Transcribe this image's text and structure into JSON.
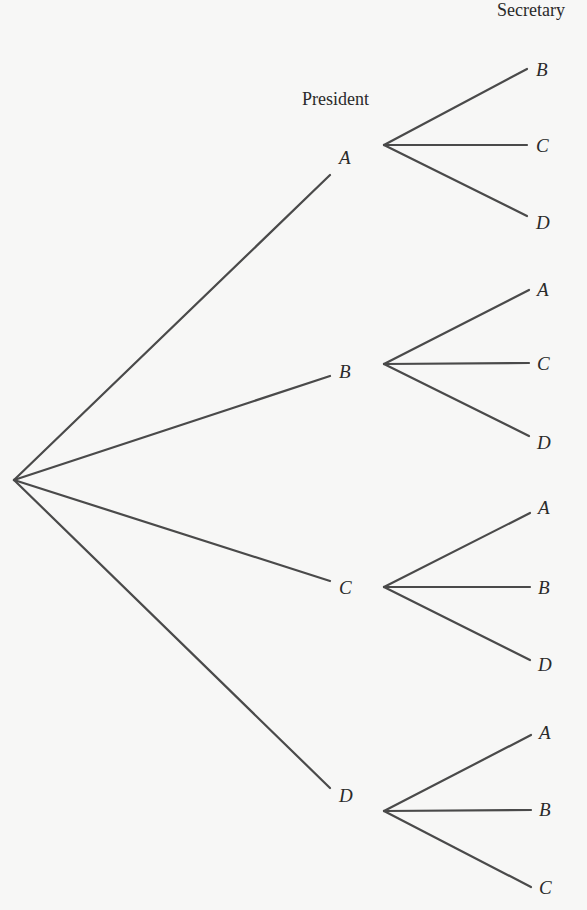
{
  "diagram": {
    "type": "tree-diagram",
    "headers": {
      "president": "President",
      "secretary": "Secretary"
    },
    "root": {
      "x": 14,
      "y": 480
    },
    "colors": {
      "line": "#4a4a4a",
      "text": "#2a2a2a",
      "background": "#f7f7f6"
    },
    "president_nodes": [
      {
        "label": "A",
        "edge_end": [
          330,
          175
        ],
        "label_pos": [
          339,
          164
        ],
        "fork": [
          384,
          145
        ],
        "secretaries": [
          {
            "label": "B",
            "end": [
              527,
              69
            ],
            "label_pos": [
              536,
              76
            ]
          },
          {
            "label": "C",
            "end": [
              527,
              145
            ],
            "label_pos": [
              536,
              152
            ]
          },
          {
            "label": "D",
            "end": [
              527,
              216
            ],
            "label_pos": [
              536,
              229
            ]
          }
        ]
      },
      {
        "label": "B",
        "edge_end": [
          330,
          376
        ],
        "label_pos": [
          339,
          378
        ],
        "fork": [
          384,
          364
        ],
        "secretaries": [
          {
            "label": "A",
            "end": [
              529,
              290
            ],
            "label_pos": [
              537,
              296
            ]
          },
          {
            "label": "C",
            "end": [
              529,
              363
            ],
            "label_pos": [
              537,
              370
            ]
          },
          {
            "label": "D",
            "end": [
              529,
              436
            ],
            "label_pos": [
              537,
              449
            ]
          }
        ]
      },
      {
        "label": "C",
        "edge_end": [
          330,
          581
        ],
        "label_pos": [
          339,
          594
        ],
        "fork": [
          384,
          587
        ],
        "secretaries": [
          {
            "label": "A",
            "end": [
              530,
              513
            ],
            "label_pos": [
              538,
              514
            ]
          },
          {
            "label": "B",
            "end": [
              530,
              587
            ],
            "label_pos": [
              538,
              594
            ]
          },
          {
            "label": "D",
            "end": [
              530,
              660
            ],
            "label_pos": [
              538,
              671
            ]
          }
        ]
      },
      {
        "label": "D",
        "edge_end": [
          330,
          788
        ],
        "label_pos": [
          339,
          802
        ],
        "fork": [
          384,
          811
        ],
        "secretaries": [
          {
            "label": "A",
            "end": [
              531,
              735
            ],
            "label_pos": [
              539,
              739
            ]
          },
          {
            "label": "B",
            "end": [
              531,
              810
            ],
            "label_pos": [
              539,
              816
            ]
          },
          {
            "label": "C",
            "end": [
              531,
              887
            ],
            "label_pos": [
              539,
              894
            ]
          }
        ]
      }
    ]
  }
}
